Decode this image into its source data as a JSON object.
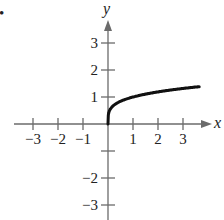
{
  "bullet": "•",
  "chart_data": {
    "type": "line",
    "title": "",
    "xlabel": "x",
    "ylabel": "y",
    "xlim": [
      -3.5,
      3.9
    ],
    "ylim": [
      -3.5,
      3.6
    ],
    "x_ticks": [
      -3,
      -2,
      -1,
      1,
      2,
      3
    ],
    "y_ticks": [
      -3,
      -2,
      -1,
      1,
      2,
      3
    ],
    "x_tick_labels": [
      "−3",
      "−2",
      "−1",
      "1",
      "2",
      "3"
    ],
    "y_tick_labels": [
      "−3",
      "−2",
      "−1",
      "1",
      "2",
      "3"
    ],
    "grid": false,
    "series": [
      {
        "name": "f(x) = x^(1/4)",
        "x": [
          0,
          0.01,
          0.05,
          0.1,
          0.25,
          0.5,
          1,
          1.5,
          2,
          2.5,
          3,
          3.5,
          3.65
        ],
        "y": [
          0,
          0.32,
          0.47,
          0.56,
          0.71,
          0.84,
          1.0,
          1.11,
          1.19,
          1.26,
          1.32,
          1.37,
          1.38
        ]
      }
    ]
  }
}
